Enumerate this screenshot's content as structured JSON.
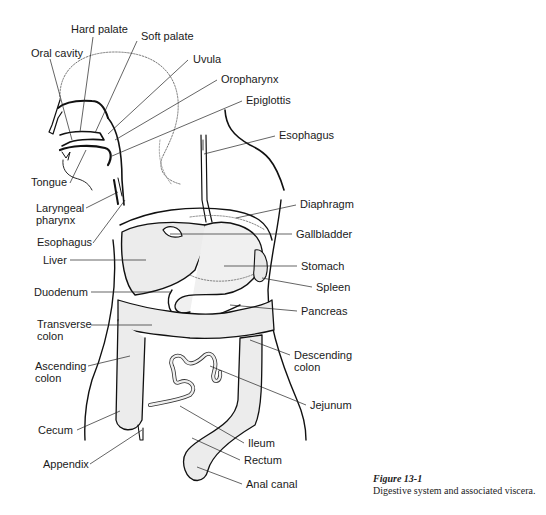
{
  "figure": {
    "number": "Figure 13-1",
    "caption": "Digestive system and associated viscera."
  },
  "labels": [
    {
      "id": "hard-palate",
      "text": "Hard palate",
      "x": 71,
      "y": 23
    },
    {
      "id": "soft-palate",
      "text": "Soft palate",
      "x": 141,
      "y": 30
    },
    {
      "id": "oral-cavity",
      "text": "Oral cavity",
      "x": 31,
      "y": 47
    },
    {
      "id": "uvula",
      "text": "Uvula",
      "x": 193,
      "y": 53
    },
    {
      "id": "oropharynx",
      "text": "Oropharynx",
      "x": 221,
      "y": 73
    },
    {
      "id": "epiglottis",
      "text": "Epiglottis",
      "x": 246,
      "y": 94
    },
    {
      "id": "esophagus-upper",
      "text": "Esophagus",
      "x": 279,
      "y": 129
    },
    {
      "id": "tongue",
      "text": "Tongue",
      "x": 31,
      "y": 176
    },
    {
      "id": "laryngeal-pharynx-1",
      "text": "Laryngeal",
      "x": 36,
      "y": 202
    },
    {
      "id": "laryngeal-pharynx-2",
      "text": "pharynx",
      "x": 36,
      "y": 214
    },
    {
      "id": "diaphragm",
      "text": "Diaphragm",
      "x": 300,
      "y": 198
    },
    {
      "id": "esophagus-lower",
      "text": "Esophagus",
      "x": 37,
      "y": 236
    },
    {
      "id": "gallbladder",
      "text": "Gallbladder",
      "x": 296,
      "y": 228
    },
    {
      "id": "liver",
      "text": "Liver",
      "x": 43,
      "y": 254
    },
    {
      "id": "stomach",
      "text": "Stomach",
      "x": 301,
      "y": 260
    },
    {
      "id": "spleen",
      "text": "Spleen",
      "x": 316,
      "y": 281
    },
    {
      "id": "duodenum",
      "text": "Duodenum",
      "x": 34,
      "y": 286
    },
    {
      "id": "pancreas",
      "text": "Pancreas",
      "x": 301,
      "y": 305
    },
    {
      "id": "transverse-colon-1",
      "text": "Transverse",
      "x": 37,
      "y": 318
    },
    {
      "id": "transverse-colon-2",
      "text": "colon",
      "x": 37,
      "y": 330
    },
    {
      "id": "descending-colon-1",
      "text": "Descending",
      "x": 294,
      "y": 349
    },
    {
      "id": "descending-colon-2",
      "text": "colon",
      "x": 294,
      "y": 361
    },
    {
      "id": "ascending-colon-1",
      "text": "Ascending",
      "x": 35,
      "y": 360
    },
    {
      "id": "ascending-colon-2",
      "text": "colon",
      "x": 35,
      "y": 372
    },
    {
      "id": "jejunum",
      "text": "Jejunum",
      "x": 310,
      "y": 399
    },
    {
      "id": "cecum",
      "text": "Cecum",
      "x": 38,
      "y": 424
    },
    {
      "id": "ileum",
      "text": "Ileum",
      "x": 248,
      "y": 437
    },
    {
      "id": "appendix",
      "text": "Appendix",
      "x": 43,
      "y": 458
    },
    {
      "id": "rectum",
      "text": "Rectum",
      "x": 244,
      "y": 454
    },
    {
      "id": "anal-canal",
      "text": "Anal canal",
      "x": 246,
      "y": 478
    }
  ]
}
